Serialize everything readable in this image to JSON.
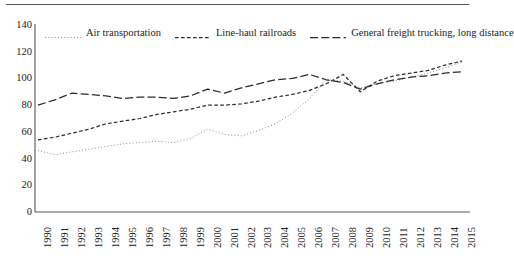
{
  "chart_data": {
    "type": "line",
    "title": "",
    "subtitle": "",
    "xlabel": "",
    "ylabel": "",
    "grid": false,
    "legend_position": "top",
    "xlim": [
      1990,
      2015
    ],
    "ylim": [
      0,
      140
    ],
    "ytick_values": [
      0,
      20,
      40,
      60,
      80,
      100,
      120,
      140
    ],
    "ytick_labels": [
      "0",
      "20",
      "40",
      "60",
      "80",
      "100",
      "120",
      "140"
    ],
    "x": [
      1990,
      1991,
      1992,
      1993,
      1994,
      1995,
      1996,
      1997,
      1998,
      1999,
      2000,
      2001,
      2002,
      2003,
      2004,
      2005,
      2006,
      2007,
      2008,
      2009,
      2010,
      2011,
      2012,
      2013,
      2014,
      2015
    ],
    "xtick_labels": [
      "1990",
      "1991",
      "1992",
      "1993",
      "1994",
      "1995",
      "1996",
      "1997",
      "1998",
      "1999",
      "2000",
      "2001",
      "2002",
      "2003",
      "2004",
      "2005",
      "2006",
      "2007",
      "2008",
      "2009",
      "2010",
      "2011",
      "2012",
      "2013",
      "2014",
      "2015"
    ],
    "series": [
      {
        "name": "Air transportation",
        "style": "dotted",
        "color": "#7a7a7a",
        "values": [
          46,
          43,
          45,
          47,
          49,
          51,
          52,
          53,
          52,
          55,
          62,
          58,
          57,
          61,
          66,
          74,
          85,
          99,
          98,
          93,
          96,
          98,
          101,
          104,
          108,
          112
        ]
      },
      {
        "name": "Line-haul railroads",
        "style": "dashed-short",
        "color": "#2b2b2b",
        "values": [
          54,
          56,
          59,
          62,
          66,
          68,
          70,
          73,
          75,
          77,
          80,
          80,
          81,
          83,
          86,
          88,
          91,
          96,
          103,
          90,
          98,
          102,
          104,
          106,
          110,
          113
        ]
      },
      {
        "name": "General freight trucking, long distance",
        "style": "dashed-long",
        "color": "#2b2b2b",
        "values": [
          80,
          84,
          89,
          88,
          87,
          85,
          86,
          86,
          85,
          87,
          92,
          89,
          93,
          96,
          99,
          100,
          103,
          99,
          97,
          92,
          96,
          99,
          101,
          102,
          104,
          105
        ]
      }
    ]
  },
  "figure": {
    "top_rule": "horizontal-rule"
  }
}
